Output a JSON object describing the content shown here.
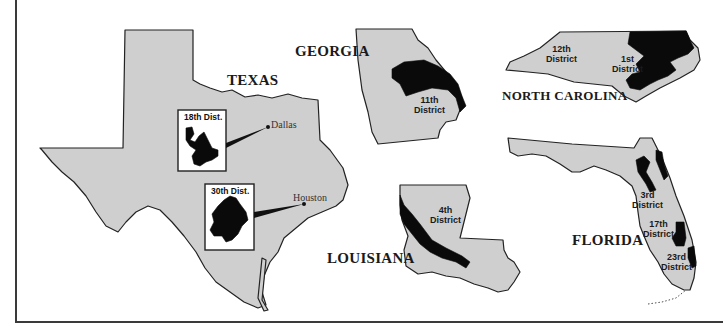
{
  "map": {
    "colors": {
      "state_fill": "#cfcfcf",
      "district_fill": "#0a0a0a",
      "outline": "#222222",
      "background": "#ffffff"
    },
    "states": [
      {
        "name": "TEXAS",
        "cities": [
          {
            "name": "Dallas",
            "inset_label": "18th Dist."
          },
          {
            "name": "Houston",
            "inset_label": "30th Dist."
          }
        ]
      },
      {
        "name": "GEORGIA",
        "districts": [
          {
            "line1": "11th",
            "line2": "District"
          }
        ]
      },
      {
        "name": "NORTH CAROLINA",
        "districts": [
          {
            "line1": "12th",
            "line2": "District"
          },
          {
            "line1": "1st",
            "line2": "District"
          }
        ]
      },
      {
        "name": "LOUISIANA",
        "districts": [
          {
            "line1": "4th",
            "line2": "District"
          }
        ]
      },
      {
        "name": "FLORIDA",
        "districts": [
          {
            "line1": "3rd",
            "line2": "District"
          },
          {
            "line1": "17th",
            "line2": "District"
          },
          {
            "line1": "23rd",
            "line2": "District"
          }
        ]
      }
    ]
  }
}
